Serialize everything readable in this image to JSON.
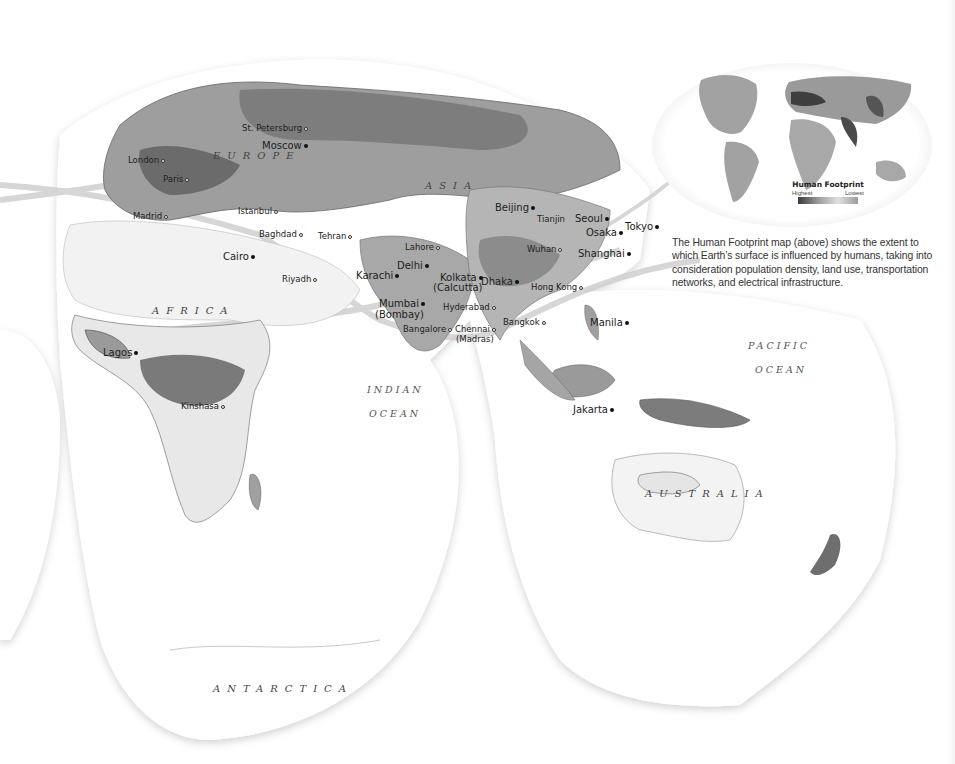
{
  "map": {
    "projection": "interrupted world map (Eastern Hemisphere focus)",
    "regions": [
      {
        "name": "EUROPE",
        "x": 213,
        "y": 150
      },
      {
        "name": "ASIA",
        "x": 425,
        "y": 180
      },
      {
        "name": "AFRICA",
        "x": 152,
        "y": 305
      },
      {
        "name": "AUSTRALIA",
        "x": 645,
        "y": 488
      },
      {
        "name": "ANTARCTICA",
        "x": 213,
        "y": 683
      }
    ],
    "oceans": [
      {
        "name": "INDIAN",
        "x": 367,
        "y": 384
      },
      {
        "name": "OCEAN",
        "x": 369,
        "y": 408
      },
      {
        "name": "PACIFIC",
        "x": 748,
        "y": 340
      },
      {
        "name": "OCEAN",
        "x": 755,
        "y": 364
      }
    ],
    "cities": [
      {
        "name": "St. Petersburg",
        "x": 242,
        "y": 124,
        "marker": "open"
      },
      {
        "name": "Moscow",
        "x": 262,
        "y": 141,
        "marker": "filled",
        "big": true
      },
      {
        "name": "London",
        "x": 128,
        "y": 156,
        "marker": "open"
      },
      {
        "name": "Paris",
        "x": 163,
        "y": 175,
        "marker": "open"
      },
      {
        "name": "Madrid",
        "x": 133,
        "y": 212,
        "marker": "open"
      },
      {
        "name": "Istanbul",
        "x": 238,
        "y": 207,
        "marker": "open"
      },
      {
        "name": "Baghdad",
        "x": 259,
        "y": 230,
        "marker": "open"
      },
      {
        "name": "Tehran",
        "x": 318,
        "y": 232,
        "marker": "open"
      },
      {
        "name": "Cairo",
        "x": 223,
        "y": 252,
        "marker": "filled",
        "big": true
      },
      {
        "name": "Riyadh",
        "x": 282,
        "y": 275,
        "marker": "open"
      },
      {
        "name": "Lahore",
        "x": 405,
        "y": 243,
        "marker": "open"
      },
      {
        "name": "Delhi",
        "x": 397,
        "y": 261,
        "marker": "filled",
        "big": true
      },
      {
        "name": "Karachi",
        "x": 356,
        "y": 271,
        "marker": "filled",
        "big": true
      },
      {
        "name": "Kolkata",
        "x": 440,
        "y": 273,
        "marker": "filled",
        "big": true
      },
      {
        "name": "(Calcutta)",
        "x": 433,
        "y": 283,
        "marker": "none",
        "big": true
      },
      {
        "name": "Dhaka",
        "x": 481,
        "y": 277,
        "marker": "filled",
        "big": true
      },
      {
        "name": "Mumbai",
        "x": 379,
        "y": 299,
        "marker": "filled",
        "big": true
      },
      {
        "name": "(Bombay)",
        "x": 375,
        "y": 310,
        "marker": "none",
        "big": true
      },
      {
        "name": "Hyderabad",
        "x": 443,
        "y": 303,
        "marker": "open"
      },
      {
        "name": "Bangalore",
        "x": 403,
        "y": 325,
        "marker": "open"
      },
      {
        "name": "Chennai",
        "x": 455,
        "y": 325,
        "marker": "open"
      },
      {
        "name": "(Madras)",
        "x": 456,
        "y": 335,
        "marker": "none"
      },
      {
        "name": "Beijing",
        "x": 495,
        "y": 203,
        "marker": "filled",
        "big": true
      },
      {
        "name": "Tianjin",
        "x": 537,
        "y": 215,
        "marker": "none"
      },
      {
        "name": "Seoul",
        "x": 575,
        "y": 214,
        "marker": "filled",
        "big": true
      },
      {
        "name": "Osaka",
        "x": 586,
        "y": 228,
        "marker": "filled",
        "big": true
      },
      {
        "name": "Tokyo",
        "x": 625,
        "y": 222,
        "marker": "filled",
        "big": true
      },
      {
        "name": "Wuhan",
        "x": 527,
        "y": 245,
        "marker": "open"
      },
      {
        "name": "Shanghai",
        "x": 578,
        "y": 249,
        "marker": "filled",
        "big": true
      },
      {
        "name": "Hong Kong",
        "x": 531,
        "y": 283,
        "marker": "open"
      },
      {
        "name": "Bangkok",
        "x": 503,
        "y": 318,
        "marker": "open"
      },
      {
        "name": "Manila",
        "x": 590,
        "y": 318,
        "marker": "filled",
        "big": true
      },
      {
        "name": "Lagos",
        "x": 103,
        "y": 348,
        "marker": "filled",
        "big": true
      },
      {
        "name": "Kinshasa",
        "x": 181,
        "y": 402,
        "marker": "open"
      },
      {
        "name": "Jakarta",
        "x": 573,
        "y": 405,
        "marker": "filled",
        "big": true
      }
    ]
  },
  "inset": {
    "title": "Human Footprint",
    "legend_high": "Highest",
    "legend_low": "Lowest"
  },
  "caption": "The Human Footprint map (above) shows the extent to which Earth’s surface is influenced by humans, taking into consideration population density, land use, transportation networks, and electrical infrastructure.",
  "colors": {
    "land_high": "#5a5a5a",
    "land_mid": "#9a9a9a",
    "land_low": "#d8d8d8",
    "ocean": "#ffffff",
    "routes": "#c8c8c8"
  }
}
